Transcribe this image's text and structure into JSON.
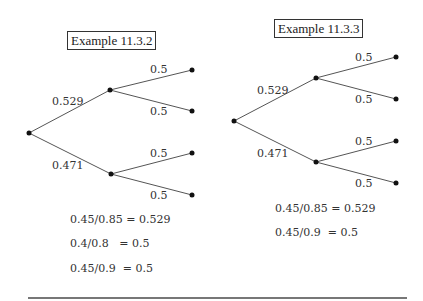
{
  "examples": [
    {
      "title": "Example 11.3.2",
      "tree": {
        "branch_upper": "0.529",
        "branch_lower": "0.471",
        "leaf_labels": [
          "0.5",
          "0.5",
          "0.5",
          "0.5"
        ]
      },
      "equations": [
        "0.45/0.85 = 0.529",
        "0.4/0.8   = 0.5",
        "0.45/0.9  = 0.5"
      ]
    },
    {
      "title": "Example 11.3.3",
      "tree": {
        "branch_upper": "0.529",
        "branch_lower": "0.471",
        "leaf_labels": [
          "0.5",
          "0.5",
          "0.5",
          "0.5"
        ]
      },
      "equations": [
        "0.45/0.85 = 0.529",
        "0.45/0.9  = 0.5"
      ]
    }
  ],
  "colors": {
    "line": "#555555",
    "node": "#111111",
    "text": "#333333"
  }
}
